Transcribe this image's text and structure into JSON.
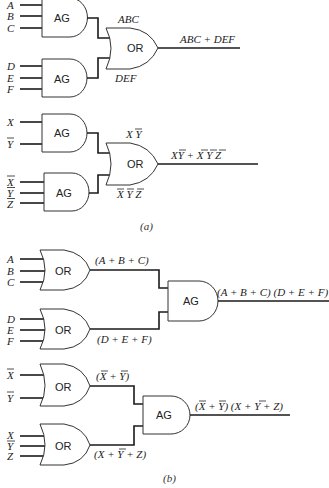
{
  "figure": {
    "part_a": {
      "caption": "(a)",
      "circuit_1": {
        "gate1": {
          "type_label": "AG",
          "inputs": [
            "A",
            "B",
            "C"
          ],
          "output_label": "ABC"
        },
        "gate2": {
          "type_label": "AG",
          "inputs": [
            "D",
            "E",
            "F"
          ],
          "output_label": "DEF"
        },
        "combiner": {
          "type_label": "OR",
          "output_label": "ABC + DEF"
        }
      },
      "circuit_2": {
        "gate1": {
          "type_label": "AG",
          "inputs": [
            "X",
            "Y"
          ],
          "inputs_complemented": [
            false,
            true
          ],
          "output_label": "X Y",
          "output_bars": [
            "Y"
          ]
        },
        "gate2": {
          "type_label": "AG",
          "inputs": [
            "X",
            "Y",
            "Z"
          ],
          "inputs_complemented": [
            true,
            true,
            true
          ],
          "output_label": "X Y Z",
          "output_bars": [
            "X",
            "Y",
            "Z"
          ]
        },
        "combiner": {
          "type_label": "OR",
          "output_label": "XY + X Y Z",
          "output_note": "X·Ȳ + X̄·Ȳ·Z̄"
        }
      }
    },
    "part_b": {
      "caption": "(b)",
      "circuit_1": {
        "gate1": {
          "type_label": "OR",
          "inputs": [
            "A",
            "B",
            "C"
          ],
          "output_label": "(A + B + C)"
        },
        "gate2": {
          "type_label": "OR",
          "inputs": [
            "D",
            "E",
            "F"
          ],
          "output_label": "(D + E + F)"
        },
        "combiner": {
          "type_label": "AG",
          "output_label": "(A + B + C) (D + E + F)"
        }
      },
      "circuit_2": {
        "gate1": {
          "type_label": "OR",
          "inputs": [
            "X",
            "Y"
          ],
          "inputs_complemented": [
            true,
            true
          ],
          "output_label": "(X + Y)",
          "output_note": "(X̄ + Ȳ)"
        },
        "gate2": {
          "type_label": "OR",
          "inputs": [
            "X",
            "Y",
            "Z"
          ],
          "inputs_complemented": [
            false,
            true,
            false
          ],
          "output_label": "(X + Y + Z)",
          "output_note": "(X + Ȳ + Z)"
        },
        "combiner": {
          "type_label": "AG",
          "output_label": "(X + Y) (X + Y + Z)",
          "output_note": "(X̄ + Ȳ)(X + Ȳ + Z)"
        }
      }
    }
  }
}
